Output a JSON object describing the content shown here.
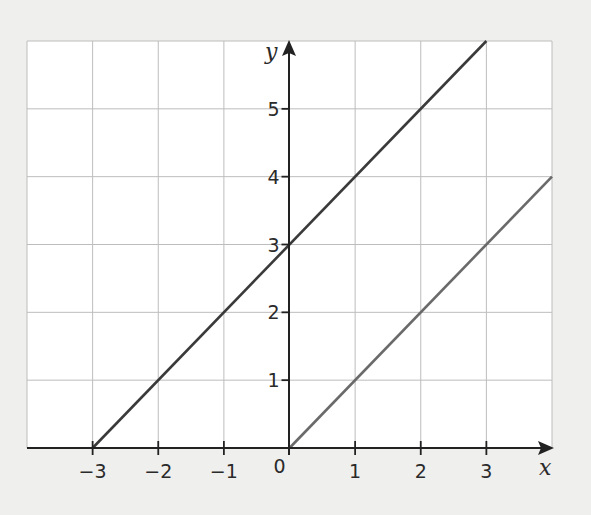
{
  "chart_data": {
    "type": "line",
    "title": "",
    "xlabel": "x",
    "ylabel": "y",
    "xlim": [
      -4,
      4
    ],
    "ylim": [
      0,
      6
    ],
    "grid": true,
    "legend": null,
    "x_ticks": [
      "−3",
      "−2",
      "−1",
      "0",
      "1",
      "2",
      "3"
    ],
    "x_tick_values": [
      -3,
      -2,
      -1,
      0,
      1,
      2,
      3
    ],
    "y_ticks": [
      "1",
      "2",
      "3",
      "4",
      "5"
    ],
    "y_tick_values": [
      1,
      2,
      3,
      4,
      5
    ],
    "series": [
      {
        "name": "y = x + 3",
        "points": [
          [
            -3,
            0
          ],
          [
            3,
            6
          ]
        ],
        "color": "#3a3a3a"
      },
      {
        "name": "y = x",
        "points": [
          [
            0,
            0
          ],
          [
            4,
            4
          ]
        ],
        "color": "#6a6a6a"
      }
    ]
  },
  "colors": {
    "background": "#efefed",
    "plot_area": "#ffffff",
    "grid": "#bdbdbd",
    "axis": "#222222"
  }
}
